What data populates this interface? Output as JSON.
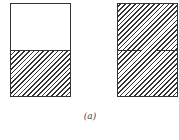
{
  "figure": {
    "caption": "(a)",
    "line_color": "#333333",
    "background": "#ffffff",
    "panels": [
      {
        "id": "left",
        "description": "Rectangle split horizontally; upper half empty, lower half hatched",
        "top_half": "empty",
        "bottom_half": "hatched",
        "divider": "solid"
      },
      {
        "id": "right",
        "description": "Rectangle fully hatched with a horizontal divider that has a small gap near the middle",
        "top_half": "hatched",
        "bottom_half": "hatched",
        "divider": "broken"
      }
    ]
  }
}
